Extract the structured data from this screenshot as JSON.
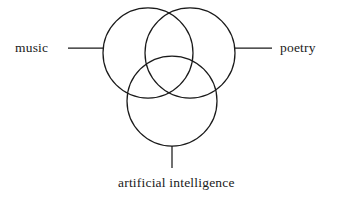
{
  "diagram": {
    "type": "venn-three-circle",
    "background_color": "#ffffff",
    "stroke_color": "#1a1a1a",
    "labels": {
      "left": "music",
      "right": "poetry",
      "bottom": "artificial intelligence"
    },
    "circles": [
      {
        "name": "music-circle",
        "cx": 148,
        "cy": 53,
        "r": 45
      },
      {
        "name": "poetry-circle",
        "cx": 190,
        "cy": 53,
        "r": 45
      },
      {
        "name": "artificial-intelligence-circle",
        "cx": 172,
        "cy": 101,
        "r": 45
      }
    ],
    "leader_lines": [
      {
        "name": "music-leader-line",
        "x1": 68,
        "y1": 48,
        "x2": 104,
        "y2": 48
      },
      {
        "name": "poetry-leader-line",
        "x1": 234,
        "y1": 48,
        "x2": 272,
        "y2": 48
      },
      {
        "name": "artificial-intelligence-leader-line",
        "x1": 172,
        "y1": 146,
        "x2": 172,
        "y2": 168
      }
    ]
  }
}
